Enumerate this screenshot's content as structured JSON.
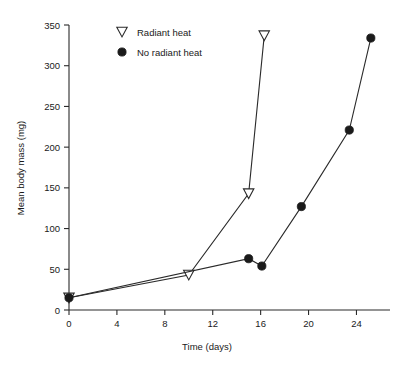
{
  "chart_data": {
    "type": "line",
    "title": "",
    "xlabel": "Time (days)",
    "ylabel": "Mean body mass (mg)",
    "xlim": [
      0,
      26.8
    ],
    "ylim": [
      0,
      350
    ],
    "xticks": [
      0,
      4,
      8,
      12,
      16,
      20,
      24
    ],
    "yticks": [
      0,
      50,
      100,
      150,
      200,
      250,
      300,
      350
    ],
    "grid": false,
    "legend_position": "top-left-inside",
    "series": [
      {
        "name": "Radiant heat",
        "marker": "open-triangle-down",
        "color": "#1a1a1a",
        "points": [
          {
            "x": 0,
            "y": 15
          },
          {
            "x": 10,
            "y": 43
          },
          {
            "x": 15,
            "y": 143
          },
          {
            "x": 16.3,
            "y": 337
          }
        ]
      },
      {
        "name": "No radiant heat",
        "marker": "filled-circle",
        "color": "#1a1a1a",
        "points": [
          {
            "x": 0,
            "y": 15
          },
          {
            "x": 15,
            "y": 63
          },
          {
            "x": 16.1,
            "y": 54
          },
          {
            "x": 19.4,
            "y": 127
          },
          {
            "x": 23.4,
            "y": 221
          },
          {
            "x": 25.2,
            "y": 334
          }
        ]
      }
    ]
  },
  "axes": {
    "x_tick_labels": [
      "0",
      "4",
      "8",
      "12",
      "16",
      "20",
      "24"
    ],
    "y_tick_labels": [
      "0",
      "50",
      "100",
      "150",
      "200",
      "250",
      "300",
      "350"
    ],
    "x_axis_title": "Time (days)",
    "y_axis_title": "Mean body mass (mg)"
  },
  "legend": {
    "entries": [
      {
        "label": "Radiant heat",
        "marker": "open-triangle-down"
      },
      {
        "label": "No radiant heat",
        "marker": "filled-circle"
      }
    ]
  }
}
